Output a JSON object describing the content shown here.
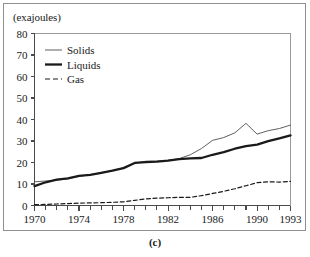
{
  "figure": {
    "caption": "(c)",
    "y_axis_units": "(exajoules)"
  },
  "chart_data": {
    "type": "line",
    "title": "",
    "xlabel": "",
    "ylabel": "(exajoules)",
    "xlim": [
      1970,
      1993
    ],
    "ylim": [
      0,
      80
    ],
    "yticks": [
      0,
      10,
      20,
      30,
      40,
      50,
      60,
      70,
      80
    ],
    "ytick_labels": [
      "0",
      "10",
      "20",
      "30",
      "40",
      "50",
      "60",
      "70",
      "80"
    ],
    "xticks": [
      1970,
      1971,
      1972,
      1973,
      1974,
      1975,
      1976,
      1977,
      1978,
      1979,
      1980,
      1981,
      1982,
      1983,
      1984,
      1985,
      1986,
      1987,
      1988,
      1989,
      1990,
      1991,
      1992,
      1993
    ],
    "xtick_labels_shown": [
      "1970",
      "1974",
      "1978",
      "1982",
      "1986",
      "1990",
      "1993"
    ],
    "grid": false,
    "legend_position": "upper left",
    "x": [
      1970,
      1971,
      1972,
      1973,
      1974,
      1975,
      1976,
      1977,
      1978,
      1979,
      1980,
      1981,
      1982,
      1983,
      1984,
      1985,
      1986,
      1987,
      1988,
      1989,
      1990,
      1991,
      1992,
      1993
    ],
    "series": [
      {
        "name": "Solids",
        "style": "thin-solid",
        "color": "#4d4d4d",
        "values": [
          11.0,
          11.4,
          11.8,
          12.4,
          13.6,
          14.3,
          15.3,
          16.2,
          17.6,
          19.6,
          20.6,
          20.6,
          21.0,
          21.8,
          23.6,
          26.5,
          30.3,
          31.6,
          33.8,
          38.2,
          33.2,
          34.8,
          35.8,
          37.4
        ]
      },
      {
        "name": "Liquids",
        "style": "thick-solid",
        "color": "#1a1a1a",
        "values": [
          9.0,
          10.8,
          12.0,
          12.6,
          13.8,
          14.2,
          15.2,
          16.2,
          17.4,
          19.8,
          20.2,
          20.4,
          20.9,
          21.6,
          21.9,
          22.1,
          23.6,
          24.8,
          26.4,
          27.6,
          28.3,
          29.9,
          31.2,
          32.6
        ]
      },
      {
        "name": "Gas",
        "style": "dashed",
        "color": "#1a1a1a",
        "values": [
          0.4,
          0.5,
          0.7,
          0.9,
          1.1,
          1.2,
          1.3,
          1.5,
          1.7,
          2.4,
          3.1,
          3.4,
          3.6,
          3.8,
          3.8,
          4.6,
          5.6,
          6.6,
          7.8,
          9.2,
          10.6,
          11.0,
          10.9,
          11.2
        ]
      }
    ],
    "legend": [
      {
        "label": "Solids",
        "style": "thin-solid"
      },
      {
        "label": "Liquids",
        "style": "thick-solid"
      },
      {
        "label": "Gas",
        "style": "dashed"
      }
    ]
  }
}
